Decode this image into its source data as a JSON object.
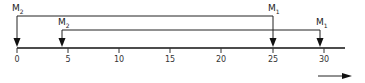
{
  "diagram": {
    "axis": {
      "ticks": [
        "0",
        "5",
        "10",
        "15",
        "20",
        "25",
        "30"
      ],
      "min": 0,
      "max": 30
    },
    "markers": [
      {
        "label": "M",
        "sub": "2",
        "position": 0
      },
      {
        "label": "M",
        "sub": "2",
        "position": 4.5
      },
      {
        "label": "M",
        "sub": "1",
        "position": 25
      },
      {
        "label": "M",
        "sub": "1",
        "position": 29.5
      }
    ],
    "brackets": [
      {
        "from": 0,
        "to": 25
      },
      {
        "from": 4.5,
        "to": 29.5
      }
    ],
    "direction_arrow": "right-arrow"
  }
}
